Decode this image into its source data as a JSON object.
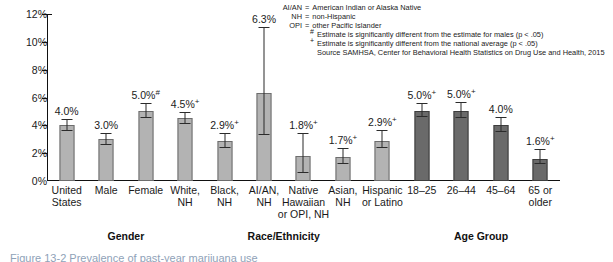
{
  "chart_data": {
    "type": "bar",
    "title": "",
    "xlabel": "",
    "ylabel": "",
    "ylim": [
      0,
      12
    ],
    "ytick_labels": [
      "0%",
      "2%",
      "4%",
      "6%",
      "8%",
      "10%",
      "12%"
    ],
    "ytick_values": [
      0,
      2,
      4,
      6,
      8,
      10,
      12
    ],
    "grid": false,
    "legend_position": "top-right",
    "categories": [
      "United States",
      "Male",
      "Female",
      "White, NH",
      "Black, NH",
      "AI/AN, NH",
      "Native Hawaiian or OPI, NH",
      "Asian, NH",
      "Hispanic or Latino",
      "18–25",
      "26–44",
      "45–64",
      "65 or older"
    ],
    "values": [
      4.0,
      3.0,
      5.0,
      4.5,
      2.9,
      6.3,
      1.8,
      1.7,
      2.9,
      5.0,
      5.0,
      4.0,
      1.6
    ],
    "error_low": [
      3.6,
      2.6,
      4.5,
      4.1,
      2.4,
      3.3,
      0.6,
      1.2,
      2.4,
      4.6,
      4.5,
      3.5,
      1.2
    ],
    "error_high": [
      4.4,
      3.4,
      5.5,
      4.9,
      3.4,
      11.0,
      3.4,
      2.3,
      3.6,
      5.5,
      5.6,
      4.5,
      2.2
    ],
    "data_labels": [
      "4.0%",
      "3.0%",
      "5.0%",
      "4.5%",
      "2.9%",
      "6.3%",
      "1.8%",
      "1.7%",
      "2.9%",
      "5.0%",
      "5.0%",
      "4.0%",
      "1.6%"
    ],
    "data_label_marks": [
      "",
      "",
      "#",
      "+",
      "+",
      "",
      "+",
      "+",
      "+",
      "+",
      "+",
      "",
      "+"
    ],
    "series_colors": {
      "light_bar": "#b3b3b3",
      "dark_bar": "#6a6a6a"
    },
    "bar_shades": [
      "light",
      "light",
      "light",
      "light",
      "light",
      "light",
      "light",
      "light",
      "light",
      "dark",
      "dark",
      "dark",
      "dark"
    ],
    "groups": [
      {
        "label": "Gender",
        "start": 1,
        "end": 2
      },
      {
        "label": "Race/Ethnicity",
        "start": 3,
        "end": 8
      },
      {
        "label": "Age Group",
        "start": 9,
        "end": 12
      }
    ]
  },
  "category_label_lines": [
    [
      "United",
      "States"
    ],
    [
      "Male"
    ],
    [
      "Female"
    ],
    [
      "White,",
      "NH"
    ],
    [
      "Black,",
      "NH"
    ],
    [
      "AI/AN,",
      "NH"
    ],
    [
      "Native",
      "Hawaiian",
      "or OPI, NH"
    ],
    [
      "Asian,",
      "NH"
    ],
    [
      "Hispanic",
      "or Latino"
    ],
    [
      "18–25"
    ],
    [
      "26–44"
    ],
    [
      "45–64"
    ],
    [
      "65 or",
      "older"
    ]
  ],
  "notes": {
    "abbreviations": [
      {
        "key": "AI/AN",
        "value": "American Indian or Alaska Native"
      },
      {
        "key": "NH",
        "value": "non-Hispanic"
      },
      {
        "key": "OPI",
        "value": "other Pacific Islander"
      }
    ],
    "symbols": [
      {
        "symbol": "#",
        "text": "Estimate is significantly different from the estimate for males (p < .05)"
      },
      {
        "symbol": "+",
        "text": "Estimate is significantly different from the national average (p < .05)"
      }
    ],
    "source": "Source SAMHSA, Center for Behavioral Health Statistics on Drug Use and Health, 2015"
  },
  "caption": "Figure 13-2  Prevalence of past-year marijuana use"
}
